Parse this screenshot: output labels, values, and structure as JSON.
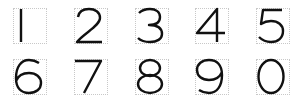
{
  "digits": [
    {
      "label": "1",
      "row": 0,
      "col": 0
    },
    {
      "label": "2",
      "row": 0,
      "col": 1
    },
    {
      "label": "3",
      "row": 0,
      "col": 2
    },
    {
      "label": "4",
      "row": 0,
      "col": 3
    },
    {
      "label": "5",
      "row": 0,
      "col": 4
    },
    {
      "label": "6",
      "row": 1,
      "col": 0
    },
    {
      "label": "7",
      "row": 1,
      "col": 1
    },
    {
      "label": "8",
      "row": 1,
      "col": 2
    },
    {
      "label": "9",
      "row": 1,
      "col": 3
    },
    {
      "label": "0",
      "row": 1,
      "col": 4
    }
  ],
  "colors": {
    "glyph": "#111111",
    "guide": "#c8c8c8",
    "background": "#ffffff"
  }
}
